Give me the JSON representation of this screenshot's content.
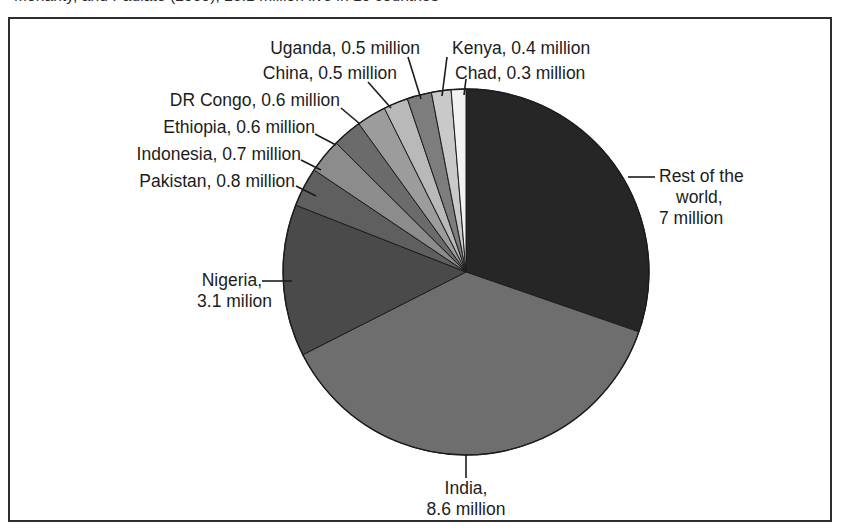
{
  "caption": {
    "text": "Mohanty, and Paulate (2009), 25.1 million live in 10 countries"
  },
  "chart_data": {
    "type": "pie",
    "title": "",
    "unit": "million",
    "total": 25.1,
    "legend": "none",
    "labels": [
      "Rest of the world",
      "India",
      "Nigeria",
      "Pakistan",
      "Indonesia",
      "Ethiopia",
      "DR Congo",
      "China",
      "Uganda",
      "Kenya",
      "Chad"
    ],
    "values": [
      7,
      8.6,
      3.1,
      0.8,
      0.7,
      0.6,
      0.6,
      0.5,
      0.5,
      0.4,
      0.3
    ],
    "colors": [
      "#262626",
      "#6e6e6e",
      "#4a4a4a",
      "#5f5f5f",
      "#8c8c8c",
      "#6b6b6b",
      "#9c9c9c",
      "#b9b9b9",
      "#7d7d7d",
      "#c9c9c9",
      "#f2f2f2"
    ],
    "slice_labels": [
      "Rest of the\nworld,\n7 million",
      "India,\n8.6 million",
      "Nigeria,\n3.1 milion",
      "Pakistan, 0.8 million",
      "Indonesia, 0.7 million",
      "Ethiopia, 0.6 million",
      "DR Congo, 0.6 million",
      "China, 0.5 million",
      "Uganda, 0.5 million",
      "Kenya, 0.4 million",
      "Chad, 0.3 million"
    ]
  },
  "labels": {
    "uganda": "Uganda, 0.5 million",
    "china": "China, 0.5 million",
    "drcongo": "DR Congo, 0.6 million",
    "ethiopia": "Ethiopia, 0.6 million",
    "indonesia": "Indonesia, 0.7 million",
    "pakistan": "Pakistan, 0.8 million",
    "kenya": "Kenya, 0.4 million",
    "chad": "Chad, 0.3 million",
    "rest_line1": "Rest of the",
    "rest_line2": "world,",
    "rest_line3": "7 million",
    "nigeria_line1": "Nigeria,",
    "nigeria_line2": "3.1 milion",
    "india_line1": "India,",
    "india_line2": "8.6 million"
  }
}
